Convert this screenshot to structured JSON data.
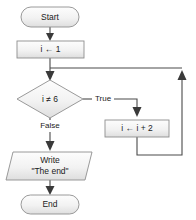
{
  "diagram": {
    "type": "flowchart",
    "colors": {
      "shape_fill_top": "#fcfcfc",
      "shape_fill_bottom": "#e2e2e2",
      "shape_stroke": "#8e8e8e",
      "connector": "#4a4a4a",
      "text": "#1b1b1b",
      "background": "#ffffff"
    },
    "nodes": {
      "start": {
        "label": "Start",
        "shape": "terminator"
      },
      "init": {
        "label": "i ← 1",
        "shape": "process"
      },
      "decision": {
        "label": "i ≠ 6",
        "shape": "decision"
      },
      "increment": {
        "label": "i ← i + 2",
        "shape": "process"
      },
      "output": {
        "label_line1": "Write",
        "label_line2": "\"The end\"",
        "shape": "parallelogram"
      },
      "end": {
        "label": "End",
        "shape": "terminator"
      }
    },
    "edge_labels": {
      "true_branch": "True",
      "false_branch": "False"
    }
  }
}
